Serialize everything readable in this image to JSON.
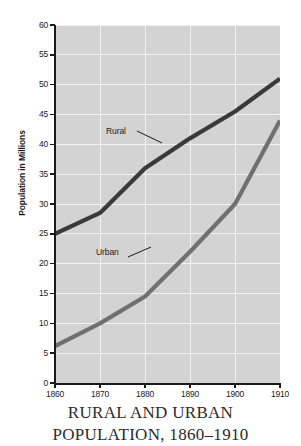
{
  "chart_data": {
    "type": "line",
    "title": "RURAL AND URBAN POPULATION, 1860–1910",
    "title_line_1": "RURAL AND URBAN",
    "title_line_2": "POPULATION, 1860–1910",
    "xlabel": "",
    "ylabel": "Population in Millions",
    "x": [
      1860,
      1870,
      1880,
      1890,
      1900,
      1910
    ],
    "xticklabels": [
      "1860",
      "1870",
      "1880",
      "1890",
      "1900",
      "1910"
    ],
    "xlim": [
      1860,
      1910
    ],
    "ylim": [
      0,
      60
    ],
    "yticks": [
      0,
      5,
      10,
      15,
      20,
      25,
      30,
      35,
      40,
      45,
      50,
      55,
      60
    ],
    "yticklabels": [
      "0",
      "5",
      "10",
      "15",
      "20",
      "25",
      "30",
      "35",
      "40",
      "45",
      "50",
      "55",
      "60"
    ],
    "grid": true,
    "grid_color": "#f2f2f2",
    "plot_background": "#d3d3d3",
    "legend": "annotated-inline",
    "series": [
      {
        "name": "Rural",
        "color": "#3a3a3a",
        "values": [
          25.0,
          28.5,
          36.0,
          41.0,
          45.5,
          51.0
        ]
      },
      {
        "name": "Urban",
        "color": "#707070",
        "values": [
          6.2,
          10.0,
          14.5,
          22.0,
          30.0,
          44.0
        ]
      }
    ],
    "annotations": [
      {
        "text": "Rural",
        "target_series": "Rural"
      },
      {
        "text": "Urban",
        "target_series": "Urban"
      }
    ]
  }
}
